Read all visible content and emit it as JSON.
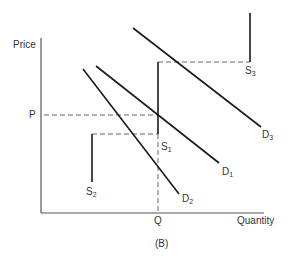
{
  "figure": {
    "caption": "(B)",
    "axes": {
      "y_label": "Price",
      "x_label": "Quantity",
      "price_marker": "P",
      "quantity_marker": "Q"
    },
    "curves": {
      "S1": {
        "base": "S",
        "sub": "1"
      },
      "S2": {
        "base": "S",
        "sub": "2"
      },
      "S3": {
        "base": "S",
        "sub": "3"
      },
      "D1": {
        "base": "D",
        "sub": "1"
      },
      "D2": {
        "base": "D",
        "sub": "2"
      },
      "D3": {
        "base": "D",
        "sub": "3"
      }
    },
    "colors": {
      "line": "#1a1a1a",
      "axis": "#555555",
      "dash": "#666666",
      "text": "#333333"
    }
  }
}
